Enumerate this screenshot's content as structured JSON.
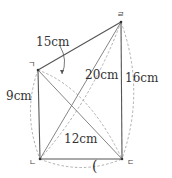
{
  "diagram": {
    "vertices": {
      "giyeok": {
        "label": "ㄱ",
        "x": 38,
        "y": 70
      },
      "nieun": {
        "label": "ㄴ",
        "x": 40,
        "y": 159
      },
      "digeut": {
        "label": "ㄷ",
        "x": 122,
        "y": 159
      },
      "rieul": {
        "label": "ㄹ",
        "x": 121,
        "y": 22
      }
    },
    "edges": [
      {
        "from": "ㄱ",
        "to": "ㄹ",
        "length": "15cm"
      },
      {
        "from": "ㄱ",
        "to": "ㄴ",
        "length": "9cm"
      },
      {
        "from": "ㄴ",
        "to": "ㄷ",
        "length": "12cm"
      },
      {
        "from": "ㄷ",
        "to": "ㄹ",
        "length": "16cm"
      },
      {
        "from": "ㄴ",
        "to": "ㄹ",
        "length": "20cm"
      },
      {
        "from": "ㄱ",
        "to": "ㄷ",
        "length": ""
      }
    ],
    "labels": {
      "len_gr": "15cm",
      "len_nr": "20cm",
      "len_dr": "16cm",
      "len_gn": "9cm",
      "len_nd": "12cm"
    },
    "answer_paren": "("
  }
}
